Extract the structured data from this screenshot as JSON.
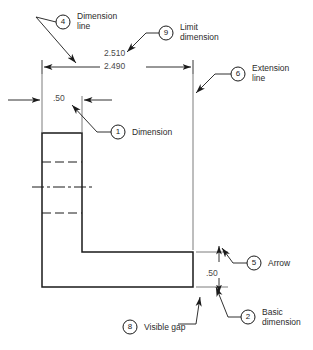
{
  "figure": {
    "type": "engineering-drawing-callout-diagram",
    "background_color": "#ffffff",
    "line_color": "#1a1a1a",
    "thin_line_color": "#6e6e6e",
    "text_color": "#2b2b2b"
  },
  "dimensions": {
    "limit_upper": "2.510",
    "limit_lower": "2.490",
    "width_dimension": ".50",
    "thickness_dimension": ".50"
  },
  "callouts": [
    {
      "id": "callout-4",
      "number": "4",
      "label": "Dimension\nline",
      "circle_x": 63,
      "circle_y": 22
    },
    {
      "id": "callout-9",
      "number": "9",
      "label": "Limit\ndimension",
      "circle_x": 166,
      "circle_y": 33
    },
    {
      "id": "callout-6",
      "number": "6",
      "label": "Extension\nline",
      "circle_x": 238,
      "circle_y": 74
    },
    {
      "id": "callout-1",
      "number": "1",
      "label": "Dimension",
      "circle_x": 118,
      "circle_y": 132
    },
    {
      "id": "callout-5",
      "number": "5",
      "label": "Arrow",
      "circle_x": 254,
      "circle_y": 263
    },
    {
      "id": "callout-2",
      "number": "2",
      "label": "Basic\ndimension",
      "circle_x": 248,
      "circle_y": 317
    },
    {
      "id": "callout-8",
      "number": "8",
      "label": "Visible gap",
      "circle_x": 130,
      "circle_y": 327
    }
  ]
}
